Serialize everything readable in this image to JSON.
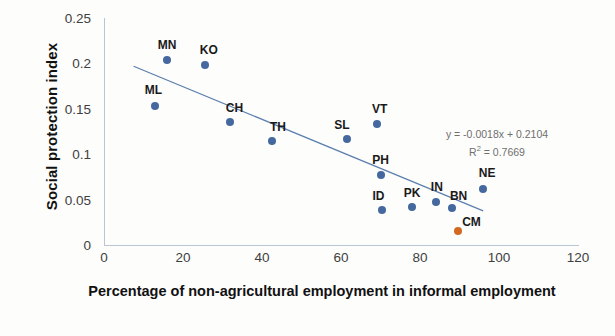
{
  "chart_data": {
    "type": "scatter",
    "title": "",
    "xlabel": "Percentage of non-agricultural employment in informal employment",
    "ylabel": "Social protection index",
    "xlim": [
      0,
      120
    ],
    "ylim": [
      0,
      0.25
    ],
    "xticks": [
      "0",
      "20",
      "40",
      "60",
      "80",
      "100",
      "120"
    ],
    "yticks": [
      "0",
      "0.05",
      "0.1",
      "0.15",
      "0.2",
      "0.25"
    ],
    "grid": false,
    "legend": "none",
    "series": [
      {
        "name": "Countries",
        "color": "#45689e",
        "points": [
          {
            "label": "MN",
            "x": 16.0,
            "y": 0.204
          },
          {
            "label": "KO",
            "x": 25.5,
            "y": 0.198
          },
          {
            "label": "ML",
            "x": 13.0,
            "y": 0.153
          },
          {
            "label": "CH",
            "x": 32.0,
            "y": 0.135
          },
          {
            "label": "TH",
            "x": 42.5,
            "y": 0.115
          },
          {
            "label": "SL",
            "x": 61.5,
            "y": 0.117
          },
          {
            "label": "VT",
            "x": 69.0,
            "y": 0.133
          },
          {
            "label": "PH",
            "x": 70.0,
            "y": 0.077
          },
          {
            "label": "ID",
            "x": 70.5,
            "y": 0.039
          },
          {
            "label": "PK",
            "x": 78.0,
            "y": 0.042
          },
          {
            "label": "IN",
            "x": 84.0,
            "y": 0.047
          },
          {
            "label": "BN",
            "x": 88.0,
            "y": 0.041
          },
          {
            "label": "NE",
            "x": 96.0,
            "y": 0.062
          }
        ]
      },
      {
        "name": "Highlighted",
        "color": "#d2691e",
        "points": [
          {
            "label": "CM",
            "x": 89.5,
            "y": 0.015
          }
        ]
      }
    ],
    "trendline": {
      "equation": "y = -0.0018x + 0.2104",
      "r_squared_label": "R² = 0.7669",
      "r_squared_prefix": "R",
      "r_squared_sup": "2",
      "r_squared_value": " = 0.7669",
      "slope": -0.0018,
      "intercept": 0.2104,
      "r2": 0.7669,
      "x_start": 7.5,
      "x_end": 96.0,
      "color": "#5b7fae"
    }
  }
}
